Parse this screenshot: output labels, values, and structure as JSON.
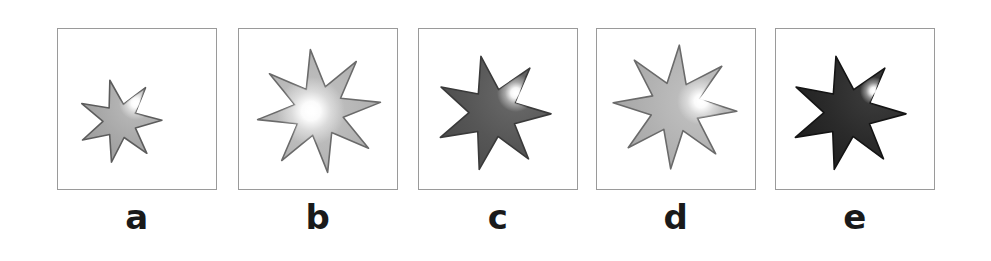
{
  "figure": {
    "type": "image-panel-series",
    "background_color": "#ffffff",
    "panel_border_color": "#9a9a9a",
    "label_color": "#1a1a1a",
    "panel_count": 5
  },
  "panels": [
    {
      "id": "a",
      "label": "a",
      "icon_name": "shaded-star-icon",
      "description": "small light-gray 7-pointed star, lower-left of frame, small white specular highlight upper-right of center",
      "star": {
        "points": 7,
        "center_x": 62,
        "center_y": 92,
        "outer_radius": 42,
        "inner_radius": 17,
        "rotation_deg": -14,
        "fill_base": "#a8a8a8",
        "fill_mid": "#bdbdbd",
        "fill_edge": "#9b9b9b",
        "stroke": "#5c5c5c",
        "highlight_x": 78,
        "highlight_y": 74,
        "highlight_radius": 17,
        "highlight_color": "#ffffff"
      }
    },
    {
      "id": "b",
      "label": "b",
      "icon_name": "shaded-star-icon",
      "description": "large light-gray 8-pointed star, centered, broad soft radial white highlight at center",
      "star": {
        "points": 8,
        "center_x": 80,
        "center_y": 82,
        "outer_radius": 62,
        "inner_radius": 25,
        "rotation_deg": -8,
        "fill_base": "#b2b2b2",
        "fill_mid": "#c8c8c8",
        "fill_edge": "#a3a3a3",
        "stroke": "#6a6a6a",
        "highlight_x": 72,
        "highlight_y": 82,
        "highlight_radius": 34,
        "highlight_color": "#ffffff"
      }
    },
    {
      "id": "c",
      "label": "c",
      "icon_name": "shaded-star-icon",
      "description": "dark-gray 7-pointed star, compact bright crescent highlight on upper-right, spike extends into highlight",
      "star": {
        "points": 7,
        "center_x": 74,
        "center_y": 84,
        "outer_radius": 58,
        "inner_radius": 24,
        "rotation_deg": -12,
        "fill_base": "#565656",
        "fill_mid": "#6b6b6b",
        "fill_edge": "#4a4a4a",
        "stroke": "#3a3a3a",
        "highlight_x": 97,
        "highlight_y": 64,
        "highlight_radius": 19,
        "highlight_color": "#ffffff"
      }
    },
    {
      "id": "d",
      "label": "d",
      "icon_name": "shaded-star-icon",
      "description": "light-gray 8-pointed star, bright highlight displaced to the right of center",
      "star": {
        "points": 8,
        "center_x": 78,
        "center_y": 78,
        "outer_radius": 62,
        "inner_radius": 25,
        "rotation_deg": 4,
        "fill_base": "#b0b0b0",
        "fill_mid": "#c4c4c4",
        "fill_edge": "#a0a0a0",
        "stroke": "#6a6a6a",
        "highlight_x": 104,
        "highlight_y": 72,
        "highlight_radius": 24,
        "highlight_color": "#ffffff"
      }
    },
    {
      "id": "e",
      "label": "e",
      "icon_name": "shaded-star-icon",
      "description": "near-black 7-pointed star, small intense white specular highlight upper-right",
      "star": {
        "points": 7,
        "center_x": 72,
        "center_y": 84,
        "outer_radius": 58,
        "inner_radius": 24,
        "rotation_deg": -12,
        "fill_base": "#2a2a2a",
        "fill_mid": "#3d3d3d",
        "fill_edge": "#1e1e1e",
        "stroke": "#141414",
        "highlight_x": 98,
        "highlight_y": 62,
        "highlight_radius": 14,
        "highlight_color": "#ffffff"
      }
    }
  ]
}
